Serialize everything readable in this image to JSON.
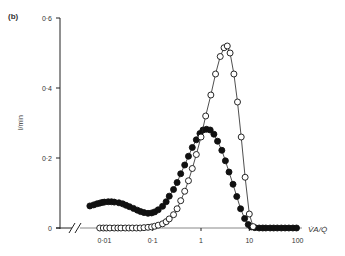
{
  "panel_label": "(b)",
  "chart_data": {
    "type": "line",
    "title": "",
    "panel_label": "(b)",
    "xlabel": "V̇A/Q̇",
    "ylabel": "l/min",
    "xscale": "log",
    "x_ticks": [
      "0·01",
      "0·1",
      "1",
      "10",
      "100"
    ],
    "x_tick_values": [
      0.01,
      0.1,
      1,
      10,
      100
    ],
    "y_ticks": [
      "0",
      "0·2",
      "0·4",
      "0·6"
    ],
    "y_tick_values": [
      0,
      0.2,
      0.4,
      0.6
    ],
    "ylim": [
      0,
      0.6
    ],
    "xlim": [
      0.005,
      100
    ],
    "axis_break": true,
    "grid": false,
    "legend": "none",
    "series": [
      {
        "name": "filled circles",
        "marker": "filled-circle",
        "color": "#111111",
        "x": [
          0.005,
          0.006,
          0.007,
          0.008,
          0.009,
          0.01,
          0.012,
          0.014,
          0.016,
          0.02,
          0.024,
          0.028,
          0.033,
          0.04,
          0.048,
          0.056,
          0.066,
          0.08,
          0.095,
          0.11,
          0.13,
          0.16,
          0.19,
          0.22,
          0.27,
          0.32,
          0.38,
          0.46,
          0.55,
          0.66,
          0.8,
          0.95,
          1.1,
          1.3,
          1.55,
          1.85,
          2.2,
          2.7,
          3.2,
          3.8,
          4.6,
          5.5,
          6.6,
          8,
          9.5,
          11,
          13,
          16,
          19,
          22,
          27,
          32,
          38,
          46,
          55,
          66,
          80,
          95
        ],
        "y": [
          0.063,
          0.066,
          0.069,
          0.071,
          0.073,
          0.074,
          0.075,
          0.075,
          0.074,
          0.072,
          0.069,
          0.065,
          0.061,
          0.056,
          0.051,
          0.047,
          0.044,
          0.042,
          0.043,
          0.046,
          0.052,
          0.062,
          0.075,
          0.091,
          0.11,
          0.13,
          0.155,
          0.18,
          0.205,
          0.23,
          0.252,
          0.27,
          0.28,
          0.282,
          0.28,
          0.268,
          0.248,
          0.222,
          0.192,
          0.16,
          0.125,
          0.09,
          0.055,
          0.027,
          0.01,
          0.003,
          0.001,
          0,
          0,
          0,
          0,
          0,
          0,
          0,
          0,
          0,
          0,
          0
        ]
      },
      {
        "name": "open circles",
        "marker": "open-circle",
        "color": "#111111",
        "x": [
          0.008,
          0.0095,
          0.011,
          0.013,
          0.016,
          0.019,
          0.022,
          0.027,
          0.032,
          0.038,
          0.046,
          0.055,
          0.066,
          0.08,
          0.095,
          0.11,
          0.13,
          0.16,
          0.19,
          0.22,
          0.27,
          0.32,
          0.38,
          0.46,
          0.55,
          0.66,
          0.8,
          1.0,
          1.25,
          1.6,
          2.0,
          2.5,
          3.0,
          3.5,
          4.0,
          4.8,
          5.7,
          6.8,
          8.2,
          10,
          12
        ],
        "y": [
          0,
          0,
          0,
          0,
          0,
          0,
          0,
          0,
          0,
          0,
          0,
          0,
          0.001,
          0.002,
          0.003,
          0.005,
          0.008,
          0.012,
          0.018,
          0.026,
          0.038,
          0.055,
          0.078,
          0.105,
          0.135,
          0.17,
          0.21,
          0.26,
          0.32,
          0.38,
          0.44,
          0.49,
          0.515,
          0.52,
          0.5,
          0.44,
          0.36,
          0.26,
          0.145,
          0.04,
          0.004
        ]
      }
    ]
  }
}
